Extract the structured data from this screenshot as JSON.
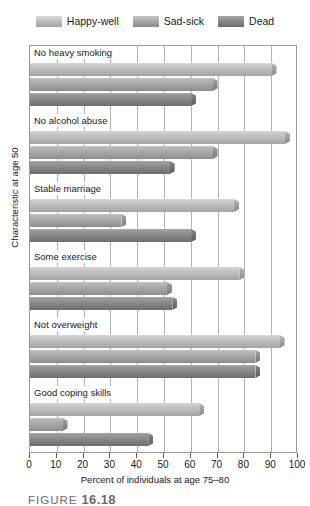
{
  "legend": {
    "position": "top",
    "entries": [
      {
        "label": "Happy-well",
        "color": "#bdbdbd",
        "icon": "legend-swatch-happy-well"
      },
      {
        "label": "Sad-sick",
        "color": "#a6a6a6",
        "icon": "legend-swatch-sad-sick"
      },
      {
        "label": "Dead",
        "color": "#878787",
        "icon": "legend-swatch-dead"
      }
    ]
  },
  "axes": {
    "y_title": "Characteristic at age 50",
    "x_title": "Percent of individuals at age 75–80",
    "x_ticks": [
      "0",
      "10",
      "20",
      "30",
      "40",
      "50",
      "60",
      "70",
      "80",
      "90",
      "100"
    ]
  },
  "caption": {
    "fig_word": "FIGURE",
    "fig_number": "16.18"
  },
  "chart_data": {
    "type": "bar",
    "orientation": "horizontal",
    "title": "",
    "xlabel": "Percent of individuals at age 75–80",
    "ylabel": "Characteristic at age 50",
    "xlim": [
      0,
      100
    ],
    "xticks": [
      0,
      10,
      20,
      30,
      40,
      50,
      60,
      70,
      80,
      90,
      100
    ],
    "grid": true,
    "legend_position": "top",
    "categories": [
      "No heavy smoking",
      "No alcohol abuse",
      "Stable marriage",
      "Some exercise",
      "Not overweight",
      "Good coping skills"
    ],
    "series": [
      {
        "name": "Happy-well",
        "color": "#bdbdbd",
        "values": [
          92,
          97,
          78,
          80,
          95,
          65
        ]
      },
      {
        "name": "Sad-sick",
        "color": "#a6a6a6",
        "values": [
          70,
          70,
          36,
          53,
          86,
          14
        ]
      },
      {
        "name": "Dead",
        "color": "#878787",
        "values": [
          62,
          54,
          62,
          55,
          86,
          46
        ]
      }
    ]
  }
}
